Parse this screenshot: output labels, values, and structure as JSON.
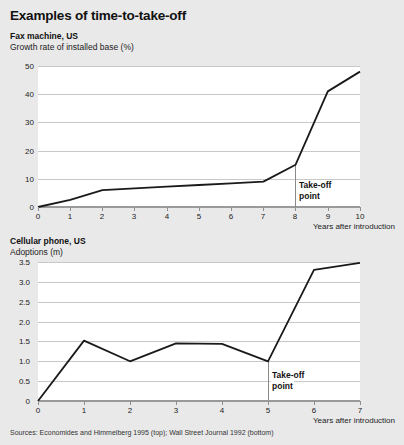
{
  "figure": {
    "title": "Examples of time-to-take-off",
    "background_color": "#e9e9e9",
    "plot_background_color": "#ffffff",
    "line_color": "#1a1a1a",
    "gridline_color": "#c8c8c8",
    "sources": "Sources: Economides and Himmelberg 1995 (top); Wall Street Journal 1992 (bottom)"
  },
  "panels": [
    {
      "title": "Fax machine, US",
      "subtitle": "Growth rate of installed base (%)",
      "xlabel": "Years after introduction",
      "annotation_line1": "Take-off",
      "annotation_line2": "point",
      "yticks": [
        "0",
        "10",
        "20",
        "30",
        "40",
        "50"
      ],
      "xticks": [
        "0",
        "1",
        "2",
        "3",
        "4",
        "5",
        "6",
        "7",
        "8",
        "9",
        "10"
      ]
    },
    {
      "title": "Cellular phone, US",
      "subtitle": "Adoptions (m)",
      "xlabel": "Years after introduction",
      "annotation_line1": "Take-off",
      "annotation_line2": "point",
      "yticks": [
        "0",
        "0.5",
        "1.0",
        "1.5",
        "2.0",
        "2.5",
        "3.0",
        "3.5"
      ],
      "xticks": [
        "0",
        "1",
        "2",
        "3",
        "4",
        "5",
        "6",
        "7"
      ]
    }
  ],
  "chart_data": [
    {
      "type": "line",
      "title": "Fax machine, US",
      "subtitle": "Growth rate of installed base (%)",
      "xlabel": "Years after introduction",
      "ylabel": "Growth rate of installed base (%)",
      "x": [
        0,
        1,
        2,
        3,
        4,
        5,
        6,
        7,
        8,
        9,
        10
      ],
      "values": [
        0,
        2.5,
        6,
        6.6,
        7.2,
        7.8,
        8.4,
        9,
        15,
        41,
        48
      ],
      "xlim": [
        0,
        10
      ],
      "ylim": [
        0,
        50
      ],
      "ytick_step": 10,
      "grid": true,
      "legend": "none",
      "annotations": [
        {
          "label": "Take-off point",
          "x": 8,
          "type": "vertical-line-with-text"
        }
      ]
    },
    {
      "type": "line",
      "title": "Cellular phone, US",
      "subtitle": "Adoptions (m)",
      "xlabel": "Years after introduction",
      "ylabel": "Adoptions (m)",
      "x": [
        0,
        1,
        2,
        3,
        4,
        5,
        6,
        7
      ],
      "values": [
        0,
        1.52,
        1.0,
        1.45,
        1.44,
        1.0,
        3.3,
        3.48
      ],
      "xlim": [
        0,
        7
      ],
      "ylim": [
        0,
        3.5
      ],
      "ytick_step": 0.5,
      "grid": true,
      "legend": "none",
      "annotations": [
        {
          "label": "Take-off point",
          "x": 5,
          "type": "vertical-line-with-text"
        }
      ]
    }
  ]
}
